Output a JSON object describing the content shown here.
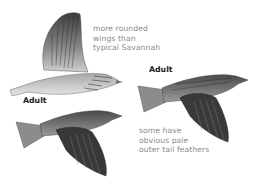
{
  "illustrations": [
    {
      "id": "bird-upper-left",
      "label": "",
      "pose": "flight, wings raised, pale underside"
    },
    {
      "id": "bird-right",
      "label": "Adult",
      "pose": "flight, wings down, streaked back"
    },
    {
      "id": "bird-lower-left",
      "label": "Adult",
      "pose": "flight, wings down, streaked back"
    }
  ],
  "annotations": {
    "rounded_wings": "more rounded\nwings than\ntypical Savannah",
    "pale_tail": "some have\nobvious pale\nouter tail feathers"
  },
  "labels": {
    "adult_right": "Adult",
    "adult_left": "Adult"
  },
  "colors": {
    "annotation_text": "#8a8a8a",
    "label_text": "#222222",
    "plumage_dark": "#3a3a3a",
    "plumage_light": "#d8d8d8"
  }
}
